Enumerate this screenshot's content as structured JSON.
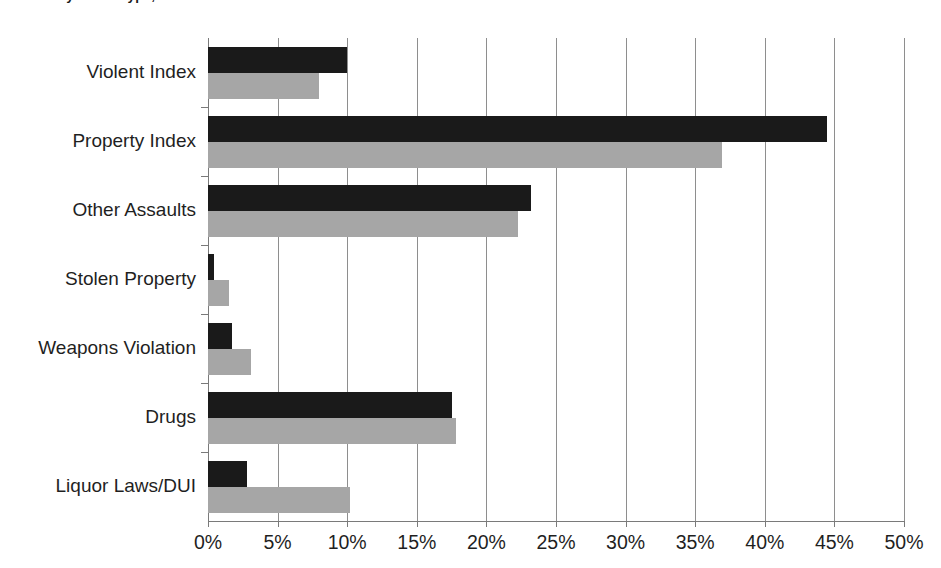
{
  "chart_data": {
    "type": "bar",
    "orientation": "horizontal",
    "title": "Arrests by Crime Type, 2011",
    "title_truncated": true,
    "categories": [
      "Violent Index",
      "Property Index",
      "Other Assaults",
      "Stolen Property",
      "Weapons Violation",
      "Drugs",
      "Liquor Laws/DUI"
    ],
    "series": [
      {
        "name": "Series 1",
        "color": "#1a1a1a",
        "values": [
          10.0,
          44.5,
          23.2,
          0.4,
          1.7,
          17.5,
          2.8
        ]
      },
      {
        "name": "Series 2",
        "color": "#a6a6a6",
        "values": [
          8.0,
          36.9,
          22.3,
          1.5,
          3.1,
          17.8,
          10.2
        ]
      }
    ],
    "xlabel": "",
    "ylabel": "",
    "xlim": [
      0,
      50
    ],
    "xtick_values": [
      0,
      5,
      10,
      15,
      20,
      25,
      30,
      35,
      40,
      45,
      50
    ],
    "xtick_labels": [
      "0%",
      "5%",
      "10%",
      "15%",
      "20%",
      "25%",
      "30%",
      "35%",
      "40%",
      "45%",
      "50%"
    ],
    "grid": "vertical",
    "legend": "none",
    "value_format": "percent"
  },
  "colors": {
    "series_dark": "#1a1a1a",
    "series_gray": "#a6a6a6",
    "gridline": "#8e8e8e",
    "axis": "#7a7a7a",
    "text": "#1f1f1f",
    "background": "#ffffff"
  }
}
